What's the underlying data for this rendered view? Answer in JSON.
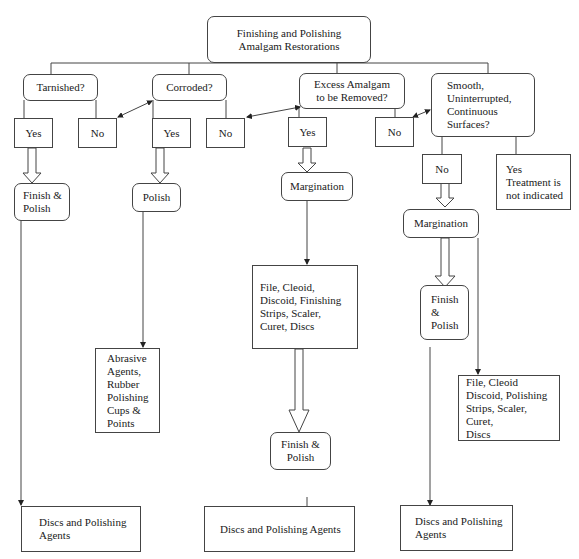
{
  "diagram": {
    "root": "Finishing and Polishing\nAmalgam Restorations",
    "questions": {
      "tarnished": "Tarnished?",
      "corroded": "Corroded?",
      "excess": "Excess Amalgam\nto be Removed?",
      "smooth": "Smooth,\nUninterrupted,\nContinuous\nSurfaces?"
    },
    "answers": {
      "tarnished_yes": "Yes",
      "tarnished_no": "No",
      "corroded_yes": "Yes",
      "corroded_no": "No",
      "excess_yes": "Yes",
      "excess_no": "No",
      "smooth_no": "No",
      "smooth_yes": "Yes\nTreatment is\nnot indicated"
    },
    "steps": {
      "tarnished_finish_polish": "Finish &\nPolish",
      "corroded_polish": "Polish",
      "excess_margination": "Margination",
      "smooth_margination": "Margination",
      "excess_finish_polish": "Finish &\nPolish",
      "smooth_finish_polish": "Finish\n&\nPolish"
    },
    "instruments": {
      "corroded_abrasive": "Abrasive\nAgents,\nRubber\nPolishing\nCups &\nPoints",
      "excess_tools": "File, Cleoid,\nDiscoid, Finishing\nStrips, Scaler,\nCuret, Discs",
      "smooth_tools": "File, Cleoid\nDiscoid, Polishing\nStrips, Scaler, Curet,\nDiscs",
      "tarnished_discs": "Discs and Polishing\nAgents",
      "excess_discs": "Discs and Polishing Agents",
      "smooth_discs": "Discs and Polishing\nAgents"
    }
  }
}
